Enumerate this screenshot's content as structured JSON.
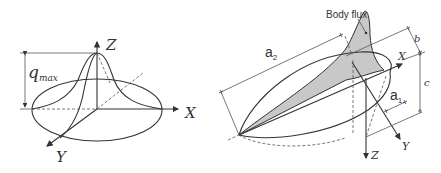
{
  "left_figure": {
    "description": "Gaussian surface heat flux distribution",
    "labels": {
      "z_axis": "Z",
      "x_axis": "X",
      "y_axis": "Y",
      "q_symbol": "q",
      "q_subscript": "max"
    }
  },
  "right_figure": {
    "description": "Double ellipsoid body heat flux distribution",
    "labels": {
      "body_flux": "Body flux",
      "a2": "a",
      "a2_sub": "2",
      "a1": "a",
      "a1_sub": "1",
      "b": "b",
      "c": "c",
      "x_axis": "X",
      "y_axis": "Y",
      "z_axis": "Z"
    }
  },
  "colors": {
    "line": "#333333",
    "shade": "#c8c8c8"
  }
}
